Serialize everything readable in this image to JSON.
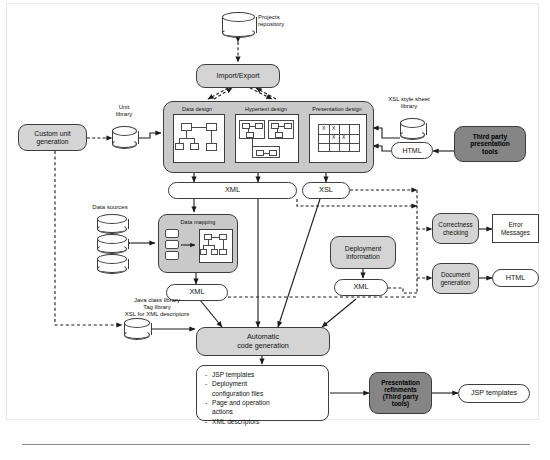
{
  "diagram": {
    "colors": {
      "light_gray": "#d4d4d4",
      "panel_gray": "#c9c9c9",
      "dark_gray": "#858585",
      "white": "#ffffff",
      "stroke": "#3d3d3d"
    }
  },
  "nodes": {
    "projects_repository": "Projects\nrepository",
    "projects_repository_l1": "Projects",
    "projects_repository_l2": "repository",
    "import_export": "Import/Export",
    "custom_unit_generation_l1": "Custom unit",
    "custom_unit_generation_l2": "generation",
    "unit_library_l1": "Unit",
    "unit_library_l2": "library",
    "data_design": "Data design",
    "hypertext_design": "Hypertext design",
    "presentation_design": "Presentation design",
    "xsl_style_sheet_library_l1": "XSL style sheet",
    "xsl_style_sheet_library_l2": "library",
    "html_top": "HTML",
    "third_party_presentation_tools_l1": "Third party",
    "third_party_presentation_tools_l2": "presentation",
    "third_party_presentation_tools_l3": "tools",
    "xml_design": "XML",
    "xsl_design": "XSL",
    "data_sources": "Data sources",
    "data_mapping": "Data mapping",
    "xml_mapping": "XML",
    "deployment_information_l1": "Deployment",
    "deployment_information_l2": "information",
    "xml_deployment": "XML",
    "correctness_checking_l1": "Correctness",
    "correctness_checking_l2": "checking",
    "error_messages_l1": "Error",
    "error_messages_l2": "Messages",
    "document_generation_l1": "Document",
    "document_generation_l2": "generation",
    "html_doc": "HTML",
    "java_class_library_l1": "Java class library",
    "java_class_library_l2": "Tag library",
    "java_class_library_l3": "XSL for XML descriptors",
    "automatic_code_generation_l1": "Automatic",
    "automatic_code_generation_l2": "code generation",
    "presentation_refinements_l1": "Presentation",
    "presentation_refinements_l2": "refinments",
    "presentation_refinements_l3": "(Third party",
    "presentation_refinements_l4": "tools)",
    "jsp_templates_out": "JSP templates"
  },
  "artifacts": {
    "items": [
      "JSP templates",
      "Deployment",
      "configuration files",
      "Page and operation",
      "actions",
      "XML descriptors"
    ]
  },
  "presentation_grid": {
    "marks": [
      "X",
      "X",
      "X",
      "X"
    ]
  }
}
